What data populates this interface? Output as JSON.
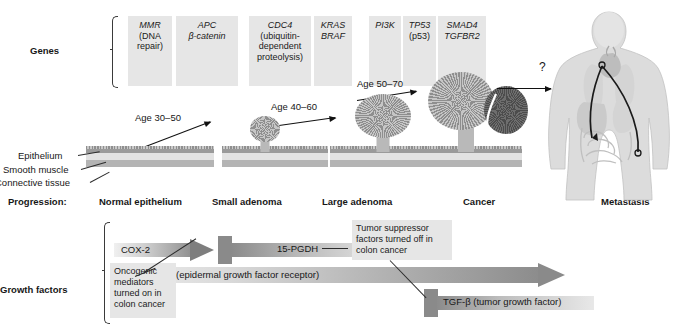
{
  "rows": {
    "genes_label": "Genes",
    "progression_label": "Progression:",
    "growth_factors_label": "Growth factors"
  },
  "genes": [
    {
      "name": "MMR",
      "sub": "(DNA repair)",
      "sub_italic": false,
      "x": 128,
      "w": 44
    },
    {
      "name": "APC",
      "sub": "β-catenin",
      "sub_italic": true,
      "x": 176,
      "w": 62
    },
    {
      "name": "CDC4",
      "sub": "(ubiquitin-dependent proteolysis)",
      "sub_italic": false,
      "x": 249,
      "w": 62
    },
    {
      "name": "KRAS",
      "sub": "BRAF",
      "sub_italic": true,
      "x": 314,
      "w": 38
    },
    {
      "name": "PI3K",
      "sub": "",
      "sub_italic": false,
      "x": 369,
      "w": 32
    },
    {
      "name": "TP53",
      "sub": "(p53)",
      "sub_italic": false,
      "x": 403,
      "w": 33
    },
    {
      "name": "SMAD4",
      "sub": "TGFBR2",
      "sub_italic": true,
      "x": 438,
      "w": 48
    }
  ],
  "ages": [
    {
      "label": "Age 30–50"
    },
    {
      "label": "Age 40–60"
    },
    {
      "label": "Age 50–70"
    }
  ],
  "question_mark": "?",
  "tissue_labels": [
    {
      "label": "Epithelium"
    },
    {
      "label": "Smooth muscle"
    },
    {
      "label": "Connective tissue"
    }
  ],
  "stages": [
    {
      "label": "Normal epithelium"
    },
    {
      "label": "Small adenoma"
    },
    {
      "label": "Large adenoma"
    },
    {
      "label": "Cancer"
    },
    {
      "label": "Metastasis"
    }
  ],
  "growth_factors": {
    "cox2": "COX-2",
    "pgdh": "15-PGDH",
    "egfr": "EGFR (epidermal growth factor receptor)",
    "tgfb": "TGF-β (tumor growth factor)",
    "callout_oncogenic": "Oncogenic mediators turned on in colon cancer",
    "callout_suppressor": "Tumor suppressor factors turned off in colon cancer"
  },
  "colors": {
    "gene_box": "#e6e6e6",
    "callout_box": "#e6e6e6",
    "arrow_dark": "#6f6f6f",
    "arrow_light": "#dedede",
    "tissue_epithelium": "#9a9a9a",
    "tissue_middle": "#e2e2e2",
    "tissue_bottom": "#b4b4b4",
    "polyp": "#b0b0b0",
    "cancer_dark": "#5a5a5a",
    "body": "#dcdcdc",
    "line": "#111111"
  }
}
